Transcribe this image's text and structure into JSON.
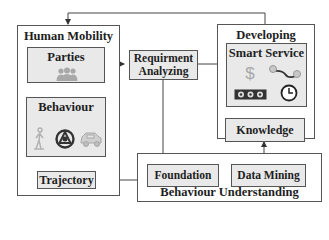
{
  "diagram": {
    "human_mobility": {
      "title": "Human Mobility",
      "parties": {
        "label": "Parties",
        "icon": "people-icon"
      },
      "behaviour": {
        "label": "Behaviour",
        "icons": [
          "walking-person-icon",
          "steering-wheel-icon",
          "car-icon"
        ]
      },
      "trajectory": {
        "label": "Trajectory"
      }
    },
    "requirement_analyzing": {
      "line1": "Requirment",
      "line2": "Analyzing"
    },
    "developing": {
      "title": "Developing",
      "smart_service": {
        "label": "Smart Service",
        "icons": [
          "dollar-icon",
          "route-pins-icon",
          "ticket-icon",
          "clock-icon"
        ]
      },
      "knowledge": {
        "label": "Knowledge"
      }
    },
    "behaviour_understanding": {
      "title": "Behaviour Understanding",
      "foundation": {
        "label": "Foundation"
      },
      "data_mining": {
        "label": "Data Mining"
      }
    },
    "colors": {
      "box_fill": "#e9e9e9",
      "border": "#555555",
      "icon_gray": "#a8a8a8",
      "icon_dark": "#333333"
    }
  }
}
